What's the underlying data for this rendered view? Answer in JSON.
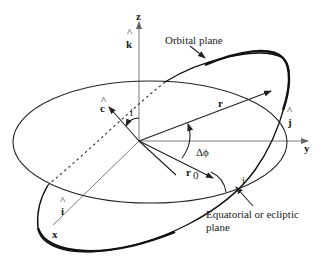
{
  "diagram": {
    "type": "orbital-geometry",
    "axes": {
      "z_label": "z",
      "y_label": "y",
      "x_label": "x"
    },
    "unit_vectors": {
      "k_hat": "k",
      "j_hat": "j",
      "i_hat": "i",
      "c_hat": "c",
      "hat": "^"
    },
    "vectors": {
      "r": "r",
      "r0_base": "r",
      "r0_sub": "0"
    },
    "angles": {
      "delta_phi": "Δϕ",
      "inclination_top": "i",
      "inclination_right": "i"
    },
    "labels": {
      "orbital_plane": "Orbital plane",
      "equatorial_line1": "Equatorial or ecliptic",
      "equatorial_line2": "plane"
    },
    "colors": {
      "lines": "#222222",
      "axes": "#7a7a7a",
      "background": "#ffffff"
    }
  }
}
